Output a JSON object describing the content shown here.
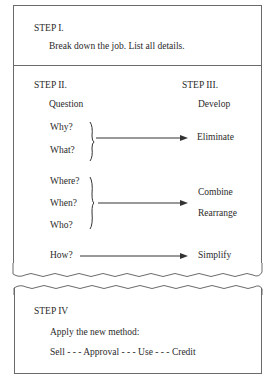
{
  "step1": {
    "title": "STEP I.",
    "text": "Break down the job.  List all details."
  },
  "step2": {
    "title": "STEP II.",
    "subtitle": "Question",
    "groups": [
      {
        "questions": [
          "Why?",
          "What?"
        ],
        "result": [
          "Eliminate"
        ]
      },
      {
        "questions": [
          "Where?",
          "When?",
          "Who?"
        ],
        "result": [
          "Combine",
          "Rearrange"
        ]
      },
      {
        "questions": [
          "How?"
        ],
        "result": [
          "Simplify"
        ]
      }
    ]
  },
  "step3": {
    "title": "STEP III.",
    "subtitle": "Develop"
  },
  "step4": {
    "title": "STEP IV",
    "text": "Apply the new method:",
    "sequence": "Sell - - - Approval - - - Use - - - Credit"
  }
}
